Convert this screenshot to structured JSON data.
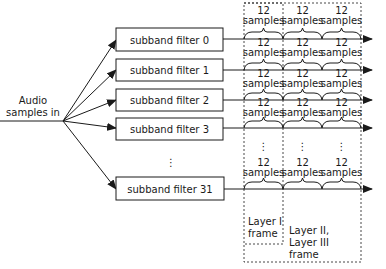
{
  "input": {
    "label_line1": "Audio",
    "label_line2": "samples in"
  },
  "filters": [
    {
      "label": "subband filter 0"
    },
    {
      "label": "subband filter 1"
    },
    {
      "label": "subband filter 2"
    },
    {
      "label": "subband filter 3"
    },
    {
      "label": "subband filter 31"
    }
  ],
  "ellipsis": "⋮",
  "group": {
    "count": "12",
    "unit": "samples"
  },
  "frames": {
    "layer1_line1": "Layer I",
    "layer1_line2": "frame",
    "layer23_line1": "Layer II,",
    "layer23_line2": "Layer III",
    "layer23_line3": "frame"
  },
  "colors": {
    "stroke": "#1a1a1a",
    "background": "#ffffff"
  }
}
